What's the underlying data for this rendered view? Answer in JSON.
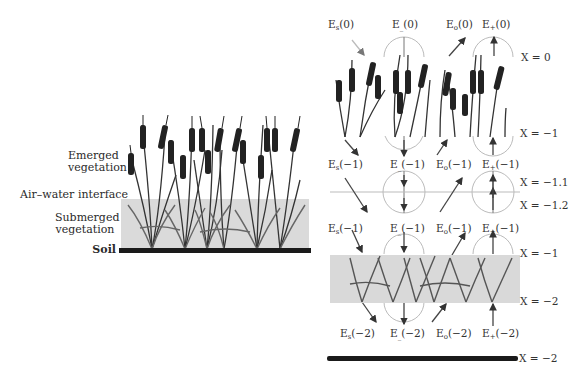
{
  "left_panel": {
    "labels": {
      "emerged_line1": "Emerged",
      "emerged_line2": "vegetation",
      "interface": "Air–water interface",
      "submerged_line1": "Submerged",
      "submerged_line2": "vegetation",
      "soil": "Soil"
    },
    "colors": {
      "water": "#d9d9d9",
      "soil": "#1a1a1a",
      "plant": "#2b2b2b"
    }
  },
  "right_panel": {
    "row0": {
      "s": "E",
      "s_sub": "s",
      "m": "E",
      "m_sub": "_",
      "o": "E",
      "o_sub": "o",
      "p": "E",
      "p_sub": "+",
      "arg": "(0)"
    },
    "row1a": {
      "s": "E",
      "s_sub": "s",
      "m": "E",
      "m_sub": "_",
      "o": "E",
      "o_sub": "o",
      "p": "E",
      "p_sub": "+",
      "arg": "(−1)"
    },
    "row1b": {
      "s": "E",
      "s_sub": "s",
      "m": "E",
      "m_sub": "_",
      "o": "E",
      "o_sub": "o",
      "p": "E",
      "p_sub": "+",
      "arg": "(−1)"
    },
    "row2": {
      "s": "E",
      "s_sub": "s",
      "m": "E",
      "m_sub": "_",
      "o": "E",
      "o_sub": "o",
      "p": "E",
      "p_sub": "+",
      "arg": "(−2)"
    },
    "x_labels": {
      "x0": "X = 0",
      "x_m1_top": "X = −1",
      "x_m1_1": "X = −1.1",
      "x_m1_2": "X = −1.2",
      "x_m1_bot": "X = −1",
      "x_m2": "X = −2",
      "x_m2_soil": "X = −2"
    }
  }
}
